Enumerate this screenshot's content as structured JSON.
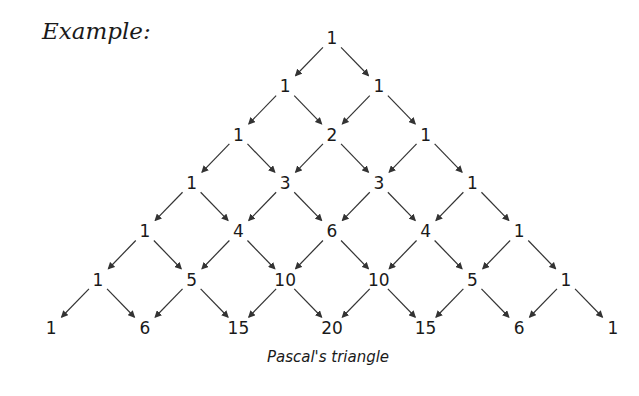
{
  "heading": "Example:",
  "caption": "Pascal's triangle",
  "rows": [
    [
      1
    ],
    [
      1,
      1
    ],
    [
      1,
      2,
      1
    ],
    [
      1,
      3,
      3,
      1
    ],
    [
      1,
      4,
      6,
      4,
      1
    ],
    [
      1,
      5,
      10,
      10,
      5,
      1
    ],
    [
      1,
      6,
      15,
      20,
      15,
      6,
      1
    ]
  ],
  "colors": {
    "text": "#1a1a1a",
    "arrow": "#333333",
    "background": "#ffffff"
  }
}
